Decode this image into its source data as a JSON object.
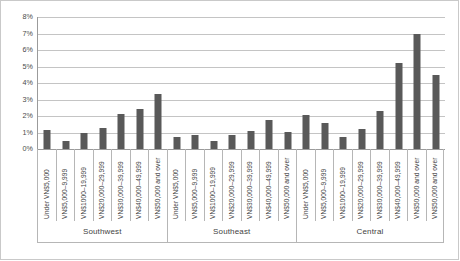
{
  "chart_data": {
    "type": "bar",
    "title": "",
    "subtitle": "",
    "xlabel": "",
    "ylabel": "",
    "ylim": [
      0,
      8
    ],
    "y_tick_labels": [
      "8%",
      "7%",
      "6%",
      "5%",
      "4%",
      "3%",
      "2%",
      "1%",
      "0%"
    ],
    "y_tick_values": [
      8,
      7,
      6,
      5,
      4,
      3,
      2,
      1,
      0
    ],
    "grid": true,
    "legend": "none",
    "value_unit": "percent",
    "bar_color": "#595959",
    "gridline_color": "#c4c4c4",
    "axis_color": "#9b9b9b",
    "categories": [
      "Under VN$5,000",
      "VN$5,000–9,999",
      "VN$1000–19,999",
      "VN$20,000–29,999",
      "VN$30,000–39,999",
      "VN$40,000–49,999",
      "VN$50,000 and over"
    ],
    "groups": [
      {
        "name": "Southwest",
        "values": [
          1.15,
          0.5,
          0.95,
          1.25,
          2.15,
          2.4,
          3.35
        ]
      },
      {
        "name": "Southeast",
        "values": [
          0.7,
          0.85,
          0.5,
          0.85,
          1.1,
          1.75,
          1.05
        ]
      },
      {
        "name": "Central",
        "values": [
          2.05,
          1.6,
          0.7,
          1.2,
          2.3,
          5.2,
          6.95
        ]
      }
    ],
    "extra_bar": {
      "group": "Central",
      "category": "VN$50,000 and over",
      "value": 4.5
    },
    "bars_flat": [
      {
        "group": "Southwest",
        "category": "Under VN$5,000",
        "value": 1.15
      },
      {
        "group": "Southwest",
        "category": "VN$5,000–9,999",
        "value": 0.5
      },
      {
        "group": "Southwest",
        "category": "VN$1000–19,999",
        "value": 0.95
      },
      {
        "group": "Southwest",
        "category": "VN$20,000–29,999",
        "value": 1.25
      },
      {
        "group": "Southwest",
        "category": "VN$30,000–39,999",
        "value": 2.15
      },
      {
        "group": "Southwest",
        "category": "VN$40,000–49,999",
        "value": 2.4
      },
      {
        "group": "Southwest",
        "category": "VN$50,000 and over",
        "value": 3.35
      },
      {
        "group": "Southeast",
        "category": "Under VN$5,000",
        "value": 0.7
      },
      {
        "group": "Southeast",
        "category": "VN$5,000–9,999",
        "value": 0.85
      },
      {
        "group": "Southeast",
        "category": "VN$1000–19,999",
        "value": 0.5
      },
      {
        "group": "Southeast",
        "category": "VN$20,000–29,999",
        "value": 0.85
      },
      {
        "group": "Southeast",
        "category": "VN$30,000–39,999",
        "value": 1.1
      },
      {
        "group": "Southeast",
        "category": "VN$40,000–49,999",
        "value": 1.75
      },
      {
        "group": "Southeast",
        "category": "VN$50,000 and over",
        "value": 1.05
      },
      {
        "group": "Central",
        "category": "Under VN$5,000",
        "value": 2.05
      },
      {
        "group": "Central",
        "category": "VN$5,000–9,999",
        "value": 1.6
      },
      {
        "group": "Central",
        "category": "VN$1000–19,999",
        "value": 0.7
      },
      {
        "group": "Central",
        "category": "VN$20,000–29,999",
        "value": 1.2
      },
      {
        "group": "Central",
        "category": "VN$30,000–39,999",
        "value": 2.3
      },
      {
        "group": "Central",
        "category": "VN$40,000–49,999",
        "value": 5.2
      },
      {
        "group": "Central",
        "category": "VN$50,000 and over",
        "value": 6.95
      },
      {
        "group": "Central",
        "category": "VN$50,000 and over",
        "value": 4.5
      }
    ]
  }
}
